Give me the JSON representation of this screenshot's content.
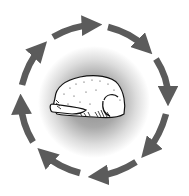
{
  "illustration": {
    "subject": "raw poultry (whole chicken/turkey)",
    "cycle_direction": "clockwise",
    "arrow_count": 8,
    "arrow_color": "#5b5b5b",
    "glow_color": "#8f8f8f",
    "background": "#ffffff"
  }
}
